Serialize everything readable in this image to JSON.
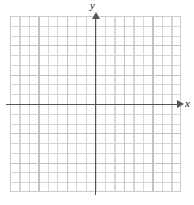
{
  "figure": {
    "kind": "blank-cartesian-coordinate-grid",
    "width": 194,
    "height": 205,
    "background_color": "#ffffff"
  },
  "axes": {
    "x": {
      "label": "x",
      "label_style": "italic",
      "arrow_direction": "right",
      "color": "#555555"
    },
    "y": {
      "label": "y",
      "label_style": "italic",
      "arrow_direction": "up",
      "color": "#555555"
    },
    "origin_visible": true,
    "tick_labels": []
  },
  "grid": {
    "minor_color": "#d6d6d6",
    "major_color": "#c2c2c2",
    "border_color": "#cdcdcd",
    "columns": 18,
    "rows": 18,
    "major_every": 3
  },
  "chart_data": {
    "type": "scatter",
    "title": "",
    "subtitle": "",
    "xlabel": "x",
    "ylabel": "y",
    "x": [],
    "y": [],
    "series": [],
    "categories": [],
    "values": [],
    "xlim": [
      -9,
      9
    ],
    "ylim": [
      -9,
      9
    ],
    "xticks": [],
    "yticks": [],
    "grid": true,
    "legend": false,
    "legend_position": "none",
    "annotations": [],
    "note": "Empty coordinate plane: grid with x and y axes drawn and labeled, no plotted data, no numeric tick labels."
  }
}
